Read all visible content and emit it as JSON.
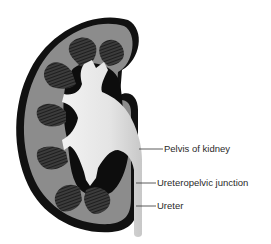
{
  "diagram": {
    "labels": [
      {
        "id": "pelvis",
        "text": "Pelvis of kidney"
      },
      {
        "id": "ureteropelvic-junction",
        "text": "Ureteropelvic junction"
      },
      {
        "id": "ureter",
        "text": "Ureter"
      }
    ],
    "colors": {
      "capsule": "#111111",
      "cortex": "#8c8c8c",
      "pyramid": "#3a3a3a",
      "pelvis": "#e6e6e6",
      "sinus": "#0d0d0d",
      "leader": "#333333"
    }
  }
}
